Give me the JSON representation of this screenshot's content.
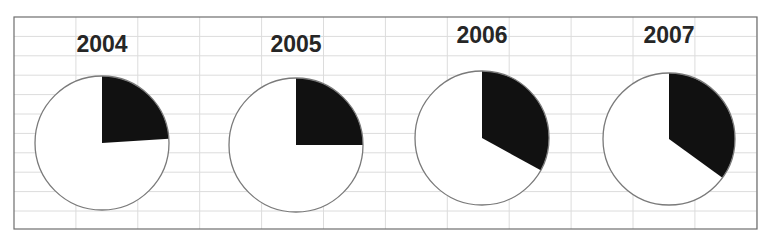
{
  "chart_data": {
    "type": "pie",
    "title": "",
    "charts": [
      {
        "title": "2004",
        "slices": [
          {
            "label": "dark",
            "value": 24,
            "color": "#111111"
          },
          {
            "label": "light",
            "value": 76,
            "color": "#ffffff"
          }
        ]
      },
      {
        "title": "2005",
        "slices": [
          {
            "label": "dark",
            "value": 25,
            "color": "#111111"
          },
          {
            "label": "light",
            "value": 75,
            "color": "#ffffff"
          }
        ]
      },
      {
        "title": "2006",
        "slices": [
          {
            "label": "dark",
            "value": 33,
            "color": "#111111"
          },
          {
            "label": "light",
            "value": 67,
            "color": "#ffffff"
          }
        ]
      },
      {
        "title": "2007",
        "slices": [
          {
            "label": "dark",
            "value": 35,
            "color": "#111111"
          },
          {
            "label": "light",
            "value": 65,
            "color": "#ffffff"
          }
        ]
      }
    ],
    "legend": null,
    "grid": true,
    "start_angle": "12 o'clock, clockwise"
  },
  "pies": [
    {
      "title": "2004",
      "cx": 102,
      "cy": 143,
      "r": 67,
      "title_y": 52
    },
    {
      "title": "2005",
      "cx": 296,
      "cy": 145,
      "r": 67,
      "title_y": 52
    },
    {
      "title": "2006",
      "cx": 482,
      "cy": 138,
      "r": 67,
      "title_y": 43
    },
    {
      "title": "2007",
      "cx": 669,
      "cy": 139,
      "r": 66,
      "title_y": 43
    }
  ],
  "colors": {
    "dark": "#111111",
    "light": "#ffffff",
    "outline": "#7a7a7a",
    "grid": "#dcdcdc",
    "frame": "#6e6e6e"
  }
}
